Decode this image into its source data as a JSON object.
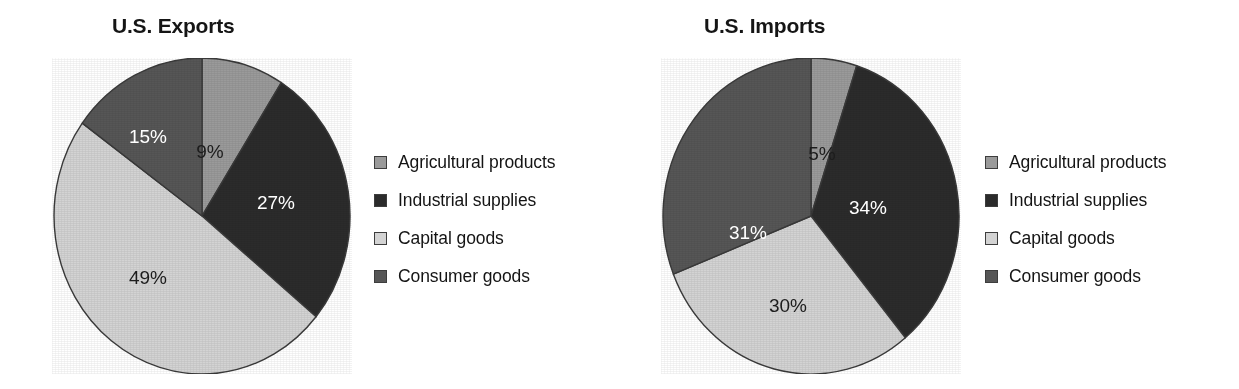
{
  "figure": {
    "background_color": "#ffffff",
    "panels": [
      "exports",
      "imports"
    ]
  },
  "palette": {
    "agricultural_products": "#9a9a9a",
    "industrial_supplies": "#2b2b2b",
    "capital_goods": "#d3d3d3",
    "consumer_goods": "#565656",
    "slice_outline": "#3a3a3a",
    "label_light_text": "#ffffff",
    "label_dark_text": "#1c1c1c"
  },
  "exports": {
    "title": "U.S. Exports",
    "labels": {
      "agricultural": "9%",
      "industrial": "27%",
      "capital": "49%",
      "consumer": "15%"
    },
    "legend": [
      {
        "label": "Agricultural products",
        "color": "#9a9a9a"
      },
      {
        "label": "Industrial supplies",
        "color": "#2b2b2b"
      },
      {
        "label": "Capital goods",
        "color": "#d3d3d3"
      },
      {
        "label": "Consumer goods",
        "color": "#565656"
      }
    ]
  },
  "imports": {
    "title": "U.S. Imports",
    "labels": {
      "agricultural": "5%",
      "industrial": "34%",
      "capital": "30%",
      "consumer": "31%"
    },
    "legend": [
      {
        "label": "Agricultural products",
        "color": "#9a9a9a"
      },
      {
        "label": "Industrial supplies",
        "color": "#2b2b2b"
      },
      {
        "label": "Capital goods",
        "color": "#d3d3d3"
      },
      {
        "label": "Consumer goods",
        "color": "#565656"
      }
    ]
  },
  "chart_data": [
    {
      "type": "pie",
      "title": "U.S. Exports",
      "categories": [
        "Agricultural products",
        "Industrial supplies",
        "Capital goods",
        "Consumer goods"
      ],
      "values": [
        9,
        27,
        49,
        15
      ],
      "value_labels": [
        "9%",
        "27%",
        "49%",
        "15%"
      ],
      "unit": "percent",
      "start_angle_deg": 0,
      "direction": "clockwise",
      "colors": [
        "#9a9a9a",
        "#2b2b2b",
        "#d3d3d3",
        "#565656"
      ],
      "legend_position": "right",
      "grid": false
    },
    {
      "type": "pie",
      "title": "U.S. Imports",
      "categories": [
        "Agricultural products",
        "Industrial supplies",
        "Capital goods",
        "Consumer goods"
      ],
      "values": [
        5,
        34,
        30,
        31
      ],
      "value_labels": [
        "5%",
        "34%",
        "30%",
        "31%"
      ],
      "unit": "percent",
      "start_angle_deg": 0,
      "direction": "clockwise",
      "colors": [
        "#9a9a9a",
        "#2b2b2b",
        "#d3d3d3",
        "#565656"
      ],
      "legend_position": "right",
      "grid": false
    }
  ]
}
